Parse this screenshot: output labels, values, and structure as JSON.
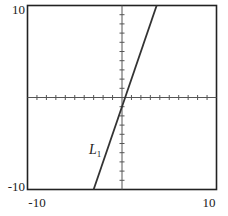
{
  "chart_data": {
    "type": "line",
    "title": "",
    "xlabel": "",
    "ylabel": "",
    "xlim": [
      -10,
      10
    ],
    "ylim": [
      -10,
      10
    ],
    "grid": false,
    "axes_through_origin": true,
    "tick_step": 1,
    "tick_labels": {
      "x_min": "-10",
      "x_max": "10",
      "y_min": "-10",
      "y_max": "10"
    },
    "series": [
      {
        "name": "L1",
        "label_text": "L",
        "label_subscript": "1",
        "equation": "y = 3x - 1",
        "x": [
          -3,
          3.667
        ],
        "y": [
          -10,
          10
        ]
      }
    ],
    "colors": {
      "line": "#333333",
      "frame": "#222222",
      "axes": "#555555"
    }
  }
}
